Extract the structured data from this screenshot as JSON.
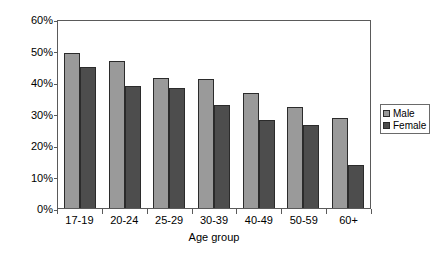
{
  "chart_data": {
    "type": "bar",
    "title": "",
    "xlabel": "Age group",
    "ylabel": "Pass rate",
    "categories": [
      "17-19",
      "20-24",
      "25-29",
      "30-39",
      "40-49",
      "50-59",
      "60+"
    ],
    "series": [
      {
        "name": "Male",
        "color": "#9a9a9a",
        "values": [
          49.3,
          46.7,
          41.2,
          40.8,
          36.5,
          32.1,
          28.6
        ]
      },
      {
        "name": "Female",
        "color": "#4d4d4d",
        "values": [
          44.7,
          38.8,
          38.0,
          32.6,
          27.8,
          26.2,
          13.7
        ]
      }
    ],
    "ylim": [
      0,
      60
    ],
    "yticks": [
      0,
      10,
      20,
      30,
      40,
      50,
      60
    ],
    "ytick_labels": [
      "0%",
      "10%",
      "20%",
      "30%",
      "40%",
      "50%",
      "60%"
    ],
    "ytick_suffix": "%",
    "grid": false,
    "legend_position": "right"
  }
}
